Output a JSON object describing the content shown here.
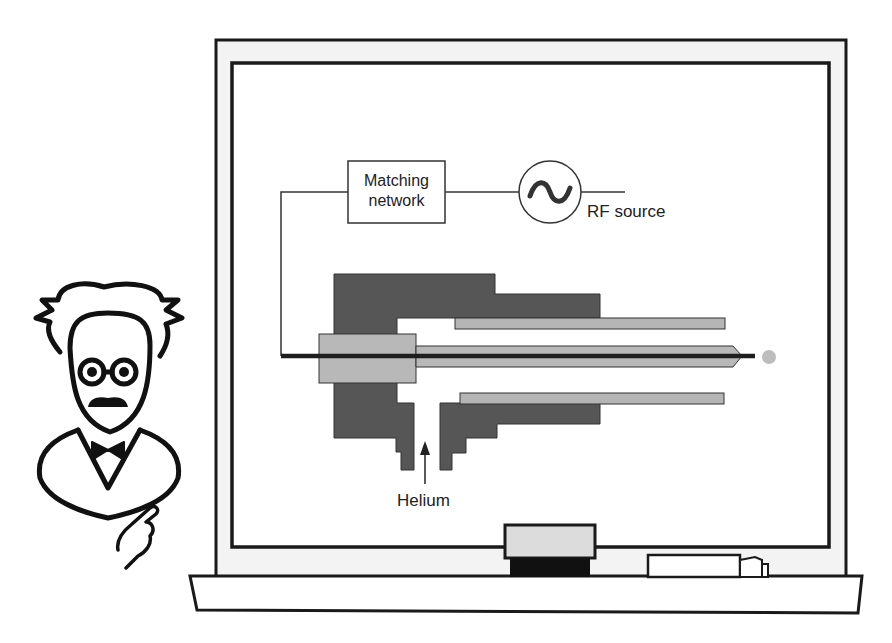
{
  "diagram": {
    "labels": {
      "matching_network_line1": "Matching",
      "matching_network_line2": "network",
      "rf_source": "RF source",
      "helium": "Helium"
    },
    "icons": {
      "rf_source_symbol": "sine-wave-in-circle",
      "professor": "professor-cartoon",
      "pointing_hand": "pointing-hand",
      "eraser": "whiteboard-eraser",
      "marker": "whiteboard-marker",
      "gas_flow_arrow": "up-arrow"
    },
    "colors": {
      "outline": "#1a1a1a",
      "electrode_dark": "#555555",
      "electrode_light": "#b3b3b3",
      "plasma_dot": "#bdbdbd",
      "board_bg": "#ffffff",
      "frame_bg": "#f2f2f2"
    }
  }
}
